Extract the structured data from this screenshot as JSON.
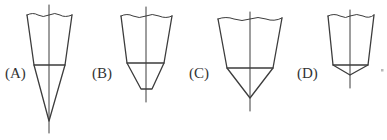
{
  "diagram": {
    "stroke_color": "#3c3c3c",
    "figures": [
      {
        "label": "(A)",
        "shape": "sharp-cone-long"
      },
      {
        "label": "(B)",
        "shape": "truncated-cone"
      },
      {
        "label": "(C)",
        "shape": "sharp-cone-medium"
      },
      {
        "label": "(D)",
        "shape": "sharp-cone-short"
      }
    ],
    "trailing_mark": "。"
  }
}
